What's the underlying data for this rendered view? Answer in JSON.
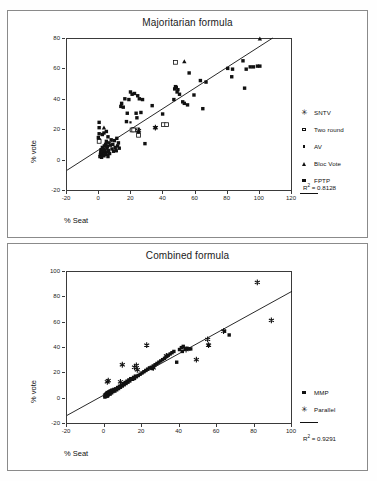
{
  "figure": {
    "panels": [
      {
        "id": "majoritarian",
        "title": "Majoritarian formula",
        "xlabel": "% Seat",
        "ylabel": "% vote",
        "r2_prefix": "R",
        "r2_sup": "2",
        "r2_text": " = 0.8128",
        "legend": [
          {
            "label": "SNTV",
            "marker": "star"
          },
          {
            "label": "Two round",
            "marker": "open-square"
          },
          {
            "label": "AV",
            "marker": "small-square"
          },
          {
            "label": "Bloc Vote",
            "marker": "triangle"
          },
          {
            "label": "FPTP",
            "marker": "square"
          }
        ]
      },
      {
        "id": "combined",
        "title": "Combined formula",
        "xlabel": "% Seat",
        "ylabel": "% vote",
        "r2_prefix": "R",
        "r2_sup": "2",
        "r2_text": " = 0.9291",
        "legend": [
          {
            "label": "MMP",
            "marker": "square"
          },
          {
            "label": "Parallel",
            "marker": "star"
          }
        ]
      }
    ]
  },
  "chart_data": [
    {
      "type": "scatter",
      "title": "Majoritarian formula",
      "xlabel": "% Seat",
      "ylabel": "% vote",
      "xlim": [
        -20,
        120
      ],
      "ylim": [
        -20,
        80
      ],
      "xticks": [
        -20,
        0,
        20,
        40,
        60,
        80,
        100,
        120
      ],
      "yticks": [
        -20,
        0,
        20,
        40,
        60,
        80
      ],
      "grid": false,
      "legend_position": "right",
      "annotations": [
        "R2 = 0.8128"
      ],
      "r2": 0.8128,
      "trendline": {
        "x": [
          -20,
          108
        ],
        "y": [
          -7,
          80
        ]
      },
      "series": [
        {
          "name": "FPTP",
          "marker": "square",
          "points": [
            [
              0.5,
              2
            ],
            [
              0.8,
              3.5
            ],
            [
              1.0,
              5
            ],
            [
              1.2,
              6.5
            ],
            [
              1.5,
              1.5
            ],
            [
              1.8,
              4
            ],
            [
              2.0,
              8
            ],
            [
              2.2,
              5.5
            ],
            [
              2.5,
              3
            ],
            [
              2.8,
              7
            ],
            [
              3.0,
              2.5
            ],
            [
              3.2,
              9
            ],
            [
              3.5,
              6
            ],
            [
              3.8,
              4.5
            ],
            [
              4.0,
              10
            ],
            [
              4.2,
              3.5
            ],
            [
              4.5,
              12
            ],
            [
              4.8,
              7.5
            ],
            [
              5.0,
              5
            ],
            [
              5.2,
              8.5
            ],
            [
              5.5,
              2
            ],
            [
              5.8,
              6
            ],
            [
              6.0,
              11
            ],
            [
              6.5,
              4
            ],
            [
              7.0,
              9.5
            ],
            [
              7.5,
              13
            ],
            [
              8.0,
              7
            ],
            [
              8.5,
              10
            ],
            [
              9.0,
              5.5
            ],
            [
              9.5,
              12.5
            ],
            [
              10.0,
              8
            ],
            [
              10.5,
              6
            ],
            [
              11.0,
              14
            ],
            [
              11.5,
              9
            ],
            [
              12.0,
              11
            ],
            [
              0.0,
              13
            ],
            [
              0.0,
              17
            ],
            [
              0.0,
              21
            ],
            [
              0.0,
              24.5
            ],
            [
              -0.5,
              14.5
            ],
            [
              2.0,
              16.5
            ],
            [
              3.0,
              17.5
            ],
            [
              4.5,
              18.5
            ],
            [
              5.5,
              15
            ],
            [
              12.5,
              7.5
            ],
            [
              13.5,
              35
            ],
            [
              14.0,
              37
            ],
            [
              15.0,
              34.5
            ],
            [
              16.0,
              40
            ],
            [
              17.0,
              25
            ],
            [
              17.5,
              30.5
            ],
            [
              18.5,
              39.5
            ],
            [
              19.5,
              44.5
            ],
            [
              20.5,
              43
            ],
            [
              21.0,
              20
            ],
            [
              21.5,
              19.5
            ],
            [
              22.0,
              43.5
            ],
            [
              23.0,
              30.5
            ],
            [
              23.5,
              27.5
            ],
            [
              24.0,
              42
            ],
            [
              24.5,
              18
            ],
            [
              25.0,
              40
            ],
            [
              26.0,
              31
            ],
            [
              27.0,
              39.5
            ],
            [
              28.5,
              10.5
            ],
            [
              33.0,
              35.5
            ],
            [
              35.0,
              21
            ],
            [
              39.5,
              30
            ],
            [
              42.0,
              23
            ],
            [
              46.5,
              39.5
            ],
            [
              47.0,
              46.5
            ],
            [
              47.5,
              48
            ],
            [
              48.0,
              47.5
            ],
            [
              48.5,
              44.5
            ],
            [
              49.0,
              46
            ],
            [
              50.0,
              43
            ],
            [
              52.0,
              38
            ],
            [
              53.0,
              37
            ],
            [
              55.0,
              36
            ],
            [
              56.0,
              57
            ],
            [
              59.0,
              42.5
            ],
            [
              63.0,
              52
            ],
            [
              64.5,
              33.5
            ],
            [
              66.5,
              51
            ],
            [
              80.0,
              60
            ],
            [
              82.5,
              54.5
            ],
            [
              83.0,
              59.5
            ],
            [
              89.5,
              65
            ],
            [
              90.5,
              47
            ],
            [
              91.5,
              59.5
            ],
            [
              94.0,
              61
            ],
            [
              96.0,
              61
            ],
            [
              98.5,
              61.5
            ],
            [
              100.0,
              61.5
            ]
          ]
        },
        {
          "name": "Two round",
          "marker": "open-square",
          "points": [
            [
              0.0,
              12
            ],
            [
              20.5,
              19.5
            ],
            [
              21.5,
              19.5
            ],
            [
              24.0,
              19.5
            ],
            [
              24.5,
              16
            ],
            [
              40.0,
              23
            ],
            [
              42.0,
              23
            ],
            [
              47.5,
              64
            ]
          ]
        },
        {
          "name": "AV",
          "marker": "small-square",
          "points": [
            [
              1.5,
              5
            ],
            [
              3.0,
              4
            ],
            [
              5.0,
              3
            ],
            [
              11.0,
              5.5
            ],
            [
              19.5,
              24.5
            ]
          ]
        },
        {
          "name": "Bloc Vote",
          "marker": "triangle",
          "points": [
            [
              3.0,
              21
            ],
            [
              53.0,
              64.5
            ],
            [
              100.0,
              79.5
            ]
          ]
        },
        {
          "name": "SNTV",
          "marker": "star",
          "points": [
            [
              24.5,
              19
            ],
            [
              35.0,
              21
            ]
          ]
        }
      ]
    },
    {
      "type": "scatter",
      "title": "Combined formula",
      "xlabel": "% Seat",
      "ylabel": "% vote",
      "xlim": [
        -20,
        100
      ],
      "ylim": [
        -20,
        100
      ],
      "xticks": [
        -20,
        0,
        20,
        40,
        60,
        80,
        100
      ],
      "yticks": [
        -20,
        0,
        20,
        40,
        60,
        80,
        100
      ],
      "grid": false,
      "legend_position": "right",
      "annotations": [
        "R2 = 0.9291"
      ],
      "r2": 0.9291,
      "trendline": {
        "x": [
          -20,
          100
        ],
        "y": [
          -14,
          84
        ]
      },
      "series": [
        {
          "name": "MMP",
          "marker": "square",
          "points": [
            [
              0.2,
              0.5
            ],
            [
              0.4,
              1.5
            ],
            [
              0.6,
              2.5
            ],
            [
              0.8,
              1.0
            ],
            [
              1.0,
              3.0
            ],
            [
              1.2,
              2.0
            ],
            [
              1.4,
              4.0
            ],
            [
              1.6,
              1.2
            ],
            [
              1.8,
              3.5
            ],
            [
              2.0,
              2.2
            ],
            [
              2.2,
              4.5
            ],
            [
              2.5,
              3.2
            ],
            [
              2.8,
              5.0
            ],
            [
              3.0,
              2.8
            ],
            [
              3.2,
              4.2
            ],
            [
              3.5,
              5.5
            ],
            [
              3.8,
              3.8
            ],
            [
              4.0,
              6.0
            ],
            [
              4.5,
              4.8
            ],
            [
              5.0,
              6.5
            ],
            [
              5.5,
              5.2
            ],
            [
              6.0,
              7.0
            ],
            [
              6.5,
              6.2
            ],
            [
              7.0,
              8.0
            ],
            [
              7.5,
              7.2
            ],
            [
              8.0,
              9.0
            ],
            [
              8.5,
              8.2
            ],
            [
              9.0,
              10.0
            ],
            [
              9.5,
              9.2
            ],
            [
              10.0,
              11.0
            ],
            [
              10.5,
              10.2
            ],
            [
              11.0,
              12.0
            ],
            [
              11.5,
              11.2
            ],
            [
              12.0,
              13.0
            ],
            [
              12.5,
              12.2
            ],
            [
              13.0,
              14.0
            ],
            [
              13.5,
              13.2
            ],
            [
              14.0,
              15.0
            ],
            [
              15.0,
              14.5
            ],
            [
              15.5,
              16.0
            ],
            [
              16.0,
              15.2
            ],
            [
              16.5,
              17.0
            ],
            [
              17.0,
              16.5
            ],
            [
              18.0,
              17.5
            ],
            [
              19.0,
              18.5
            ],
            [
              20.0,
              19.5
            ],
            [
              21.0,
              20.5
            ],
            [
              22.0,
              21.5
            ],
            [
              23.0,
              22.5
            ],
            [
              24.0,
              23.5
            ],
            [
              25.0,
              24.0
            ],
            [
              25.5,
              23.0
            ],
            [
              26.0,
              25.0
            ],
            [
              27.0,
              26.0
            ],
            [
              28.0,
              27.0
            ],
            [
              29.0,
              28.0
            ],
            [
              30.0,
              29.0
            ],
            [
              31.0,
              30.0
            ],
            [
              32.0,
              31.0
            ],
            [
              33.0,
              32.5
            ],
            [
              34.0,
              33.5
            ],
            [
              35.0,
              34.5
            ],
            [
              36.0,
              35.5
            ],
            [
              37.0,
              36.5
            ],
            [
              38.5,
              28.0
            ],
            [
              40.0,
              38.0
            ],
            [
              41.0,
              39.5
            ],
            [
              41.5,
              36.5
            ],
            [
              42.0,
              40.5
            ],
            [
              43.0,
              38.5
            ],
            [
              44.0,
              39.0
            ],
            [
              45.0,
              38.5
            ],
            [
              46.0,
              38.5
            ],
            [
              55.5,
              41.5
            ],
            [
              64.0,
              52.5
            ],
            [
              66.5,
              49.5
            ]
          ]
        },
        {
          "name": "Parallel",
          "marker": "star",
          "points": [
            [
              0.5,
              2.0
            ],
            [
              1.5,
              12.5
            ],
            [
              2.0,
              13.5
            ],
            [
              8.5,
              12.5
            ],
            [
              9.5,
              26.0
            ],
            [
              16.0,
              24.0
            ],
            [
              17.0,
              25.5
            ],
            [
              17.5,
              22.0
            ],
            [
              22.5,
              41.5
            ],
            [
              26.0,
              23.5
            ],
            [
              33.0,
              33.0
            ],
            [
              43.5,
              38.0
            ],
            [
              49.0,
              30.0
            ],
            [
              55.0,
              46.0
            ],
            [
              55.5,
              41.5
            ],
            [
              63.5,
              52.5
            ],
            [
              81.5,
              91.0
            ],
            [
              89.0,
              61.0
            ]
          ]
        }
      ]
    }
  ]
}
